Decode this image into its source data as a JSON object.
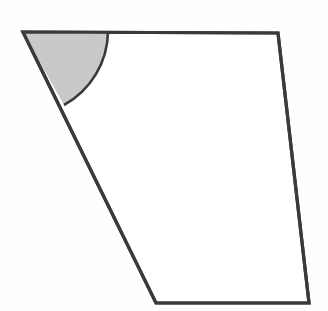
{
  "figure": {
    "kind": "geometry-diagram",
    "canvas": {
      "width": 328,
      "height": 311,
      "background": "#fefefe"
    },
    "style": {
      "stroke_color": "#3a3a3a",
      "stroke_width": 3.2,
      "shape_fill": "#ffffff",
      "angle_fill": "#c9c9c9",
      "angle_stroke": "#3a3a3a",
      "angle_stroke_width": 2.6
    },
    "vertices": [
      {
        "label": "top-left",
        "x": 23,
        "y": 32
      },
      {
        "label": "top-right",
        "x": 278,
        "y": 33
      },
      {
        "label": "bottom-right",
        "x": 309,
        "y": 303
      },
      {
        "label": "bottom-left",
        "x": 156,
        "y": 303
      }
    ],
    "polygon_points": "23,32 278,33 309,303 156,303",
    "edges": [
      {
        "name": "top-edge",
        "from": "top-left",
        "to": "top-right"
      },
      {
        "name": "right-edge",
        "from": "top-right",
        "to": "bottom-right"
      },
      {
        "name": "bottom-edge",
        "from": "bottom-right",
        "to": "bottom-left"
      },
      {
        "name": "left-edge",
        "from": "bottom-left",
        "to": "top-left"
      }
    ],
    "angle_marker": {
      "at_vertex": "top-left",
      "center_x": 23,
      "center_y": 32,
      "radius": 85,
      "arc_start_x": 108,
      "arc_start_y": 32,
      "arc_end_x": 64,
      "arc_end_y": 105,
      "sector_path": "M 23 32 L 108 32 A 85 85 0 0 1 64 105 Z",
      "arc_path": "M 108 32 A 85 85 0 0 1 64 105",
      "shaded": true
    },
    "labels": []
  }
}
